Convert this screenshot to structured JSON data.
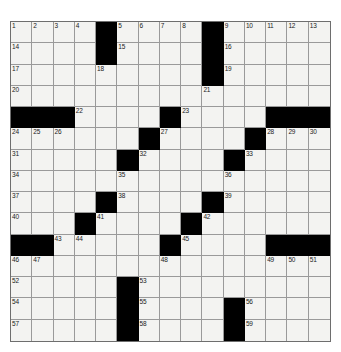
{
  "puzzle": {
    "type": "crossword-grid",
    "rows": 15,
    "cols": 15,
    "colors": {
      "block": "#000000",
      "cell": "#f3f3f1",
      "gridline": "#9a9a9a",
      "number": "#1a1a1a",
      "page_background": "#ffffff"
    },
    "blocks": [
      [
        0,
        4
      ],
      [
        0,
        9
      ],
      [
        1,
        4
      ],
      [
        1,
        9
      ],
      [
        2,
        9
      ],
      [
        4,
        0
      ],
      [
        4,
        1
      ],
      [
        4,
        2
      ],
      [
        4,
        7
      ],
      [
        4,
        12
      ],
      [
        4,
        13
      ],
      [
        4,
        14
      ],
      [
        5,
        6
      ],
      [
        5,
        11
      ],
      [
        6,
        5
      ],
      [
        6,
        10
      ],
      [
        8,
        4
      ],
      [
        8,
        9
      ],
      [
        9,
        3
      ],
      [
        9,
        8
      ],
      [
        10,
        0
      ],
      [
        10,
        1
      ],
      [
        10,
        7
      ],
      [
        10,
        12
      ],
      [
        10,
        13
      ],
      [
        10,
        14
      ],
      [
        12,
        5
      ],
      [
        13,
        5
      ],
      [
        13,
        10
      ],
      [
        14,
        5
      ],
      [
        14,
        10
      ]
    ],
    "numbers": [
      {
        "row": 0,
        "col": 0,
        "n": "1"
      },
      {
        "row": 0,
        "col": 1,
        "n": "2"
      },
      {
        "row": 0,
        "col": 2,
        "n": "3"
      },
      {
        "row": 0,
        "col": 3,
        "n": "4"
      },
      {
        "row": 0,
        "col": 5,
        "n": "5"
      },
      {
        "row": 0,
        "col": 6,
        "n": "6"
      },
      {
        "row": 0,
        "col": 7,
        "n": "7"
      },
      {
        "row": 0,
        "col": 8,
        "n": "8"
      },
      {
        "row": 0,
        "col": 10,
        "n": "9"
      },
      {
        "row": 0,
        "col": 11,
        "n": "10"
      },
      {
        "row": 0,
        "col": 12,
        "n": "11"
      },
      {
        "row": 0,
        "col": 13,
        "n": "12"
      },
      {
        "row": 0,
        "col": 14,
        "n": "13"
      },
      {
        "row": 1,
        "col": 0,
        "n": "14"
      },
      {
        "row": 1,
        "col": 5,
        "n": "15"
      },
      {
        "row": 1,
        "col": 10,
        "n": "16"
      },
      {
        "row": 2,
        "col": 0,
        "n": "17"
      },
      {
        "row": 2,
        "col": 4,
        "n": "18"
      },
      {
        "row": 2,
        "col": 10,
        "n": "19"
      },
      {
        "row": 3,
        "col": 0,
        "n": "20"
      },
      {
        "row": 3,
        "col": 9,
        "n": "21"
      },
      {
        "row": 4,
        "col": 3,
        "n": "22"
      },
      {
        "row": 4,
        "col": 8,
        "n": "23"
      },
      {
        "row": 5,
        "col": 0,
        "n": "24"
      },
      {
        "row": 5,
        "col": 1,
        "n": "25"
      },
      {
        "row": 5,
        "col": 2,
        "n": "26"
      },
      {
        "row": 5,
        "col": 7,
        "n": "27"
      },
      {
        "row": 5,
        "col": 12,
        "n": "28"
      },
      {
        "row": 5,
        "col": 13,
        "n": "29"
      },
      {
        "row": 5,
        "col": 14,
        "n": "30"
      },
      {
        "row": 6,
        "col": 0,
        "n": "31"
      },
      {
        "row": 6,
        "col": 6,
        "n": "32"
      },
      {
        "row": 6,
        "col": 11,
        "n": "33"
      },
      {
        "row": 7,
        "col": 0,
        "n": "34"
      },
      {
        "row": 7,
        "col": 5,
        "n": "35"
      },
      {
        "row": 7,
        "col": 10,
        "n": "36"
      },
      {
        "row": 8,
        "col": 0,
        "n": "37"
      },
      {
        "row": 8,
        "col": 5,
        "n": "38"
      },
      {
        "row": 8,
        "col": 10,
        "n": "39"
      },
      {
        "row": 9,
        "col": 0,
        "n": "40"
      },
      {
        "row": 9,
        "col": 4,
        "n": "41"
      },
      {
        "row": 9,
        "col": 9,
        "n": "42"
      },
      {
        "row": 10,
        "col": 2,
        "n": "43"
      },
      {
        "row": 10,
        "col": 3,
        "n": "44"
      },
      {
        "row": 10,
        "col": 8,
        "n": "45"
      },
      {
        "row": 11,
        "col": 0,
        "n": "46"
      },
      {
        "row": 11,
        "col": 1,
        "n": "47"
      },
      {
        "row": 11,
        "col": 7,
        "n": "48"
      },
      {
        "row": 11,
        "col": 12,
        "n": "49"
      },
      {
        "row": 11,
        "col": 13,
        "n": "50"
      },
      {
        "row": 11,
        "col": 14,
        "n": "51"
      },
      {
        "row": 12,
        "col": 0,
        "n": "52"
      },
      {
        "row": 12,
        "col": 6,
        "n": "53"
      },
      {
        "row": 13,
        "col": 0,
        "n": "54"
      },
      {
        "row": 13,
        "col": 6,
        "n": "55"
      },
      {
        "row": 13,
        "col": 11,
        "n": "56"
      },
      {
        "row": 14,
        "col": 0,
        "n": "57"
      },
      {
        "row": 14,
        "col": 6,
        "n": "58"
      },
      {
        "row": 14,
        "col": 11,
        "n": "59"
      }
    ],
    "letters": []
  }
}
